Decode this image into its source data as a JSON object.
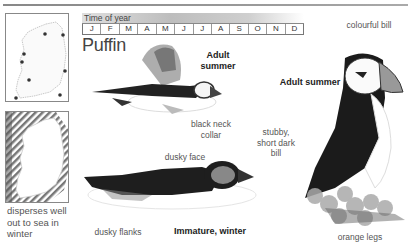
{
  "species": {
    "name": "Puffin"
  },
  "time_of_year": {
    "title": "Time of year",
    "months": [
      "J",
      "F",
      "M",
      "A",
      "M",
      "J",
      "J",
      "A",
      "S",
      "O",
      "N",
      "D"
    ]
  },
  "maps": {
    "summer": {
      "name": "breeding-distribution-map"
    },
    "winter": {
      "name": "winter-distribution-map",
      "caption": "disperses well out to sea in winter"
    }
  },
  "illustrations": {
    "flying": {
      "title_line1": "Adult",
      "title_line2": "summer",
      "labels": {
        "collar_line1": "black neck",
        "collar_line2": "collar"
      }
    },
    "swimming": {
      "title": "Immature, winter",
      "labels": {
        "face": "dusky face",
        "flanks": "dusky flanks",
        "bill_line1": "stubby,",
        "bill_line2": "short dark",
        "bill_line3": "bill"
      }
    },
    "standing": {
      "title": "Adult summer",
      "labels": {
        "bill": "colourful bill",
        "legs": "orange legs"
      }
    }
  },
  "colors": {
    "text": "#444444",
    "bar_gradient_dark": "#bdbdbd",
    "rule": "#888888"
  }
}
